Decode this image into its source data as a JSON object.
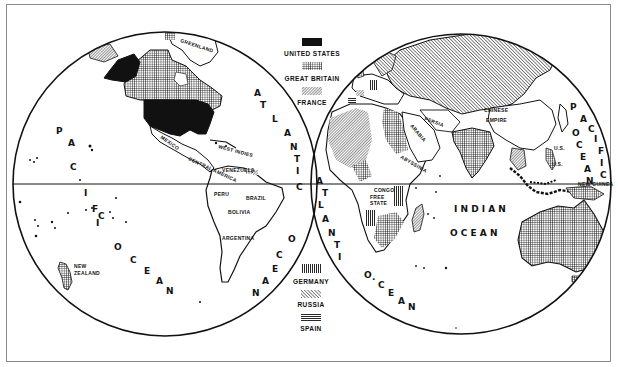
{
  "map": {
    "type": "hemispheres",
    "equator_label": "",
    "colors": {
      "ink": "#111111",
      "paper": "#ffffff",
      "frame": "#8a8a8a"
    }
  },
  "legend": {
    "top": [
      {
        "key": "us",
        "label": "UNITED STATES",
        "pattern": "solid-black"
      },
      {
        "key": "gb",
        "label": "GREAT BRITAIN",
        "pattern": "crosshatch"
      },
      {
        "key": "fr",
        "label": "FRANCE",
        "pattern": "diagonal-fine"
      }
    ],
    "bottom": [
      {
        "key": "de",
        "label": "GERMANY",
        "pattern": "vertical-lines"
      },
      {
        "key": "ru",
        "label": "RUSSIA",
        "pattern": "diagonal-bold"
      },
      {
        "key": "es",
        "label": "SPAIN",
        "pattern": "horizontal-lines"
      }
    ]
  },
  "oceans": {
    "west_pacific": [
      "P",
      "A",
      "C",
      "I",
      "F",
      "I",
      "C"
    ],
    "west_pacific_ocean": [
      "O",
      "C",
      "E",
      "A",
      "N"
    ],
    "atlantic_west": [
      "A",
      "T",
      "L",
      "A",
      "N",
      "T",
      "I",
      "C"
    ],
    "atlantic_west_ocean": [
      "O",
      "C",
      "E",
      "A",
      "N"
    ],
    "atlantic_east": [
      "A",
      "T",
      "L",
      "A",
      "N",
      "T",
      "I",
      "C"
    ],
    "atlantic_east_ocean": [
      "O",
      "·",
      "C",
      "E",
      "A",
      "N"
    ],
    "indian": "I N D I A N",
    "indian_ocean": "O C E A N",
    "pacific_east": [
      "P",
      "A",
      "C",
      "I",
      "F",
      "I",
      "C"
    ],
    "pacific_east_ocean": [
      "O",
      "C",
      "E",
      "A",
      "N"
    ]
  },
  "places": {
    "greenland": "GREENLAND",
    "mexico": "MEXICO",
    "west_indies": "WEST INDIES",
    "central_america": "CENTRAL AMERICA",
    "venezuela": "VENEZUELA",
    "peru": "PERU",
    "brazil": "BRAZIL",
    "bolivia": "BOLIVIA",
    "argentina": "ARGENTINA",
    "new_zealand_1": "NEW",
    "new_zealand_2": "ZEALAND",
    "persia": "PERSIA",
    "arabia": "ARABIA",
    "chinese_1": "CHINESE",
    "chinese_2": "EMPIRE",
    "congo_1": "CONGO",
    "congo_2": "FREE",
    "congo_3": "STATE",
    "abyssinia": "ABYSSINIA",
    "us_pacific_1": "U.S.",
    "us_pacific_2": "U.S.",
    "new_guinea": "NEW GUINEA"
  }
}
